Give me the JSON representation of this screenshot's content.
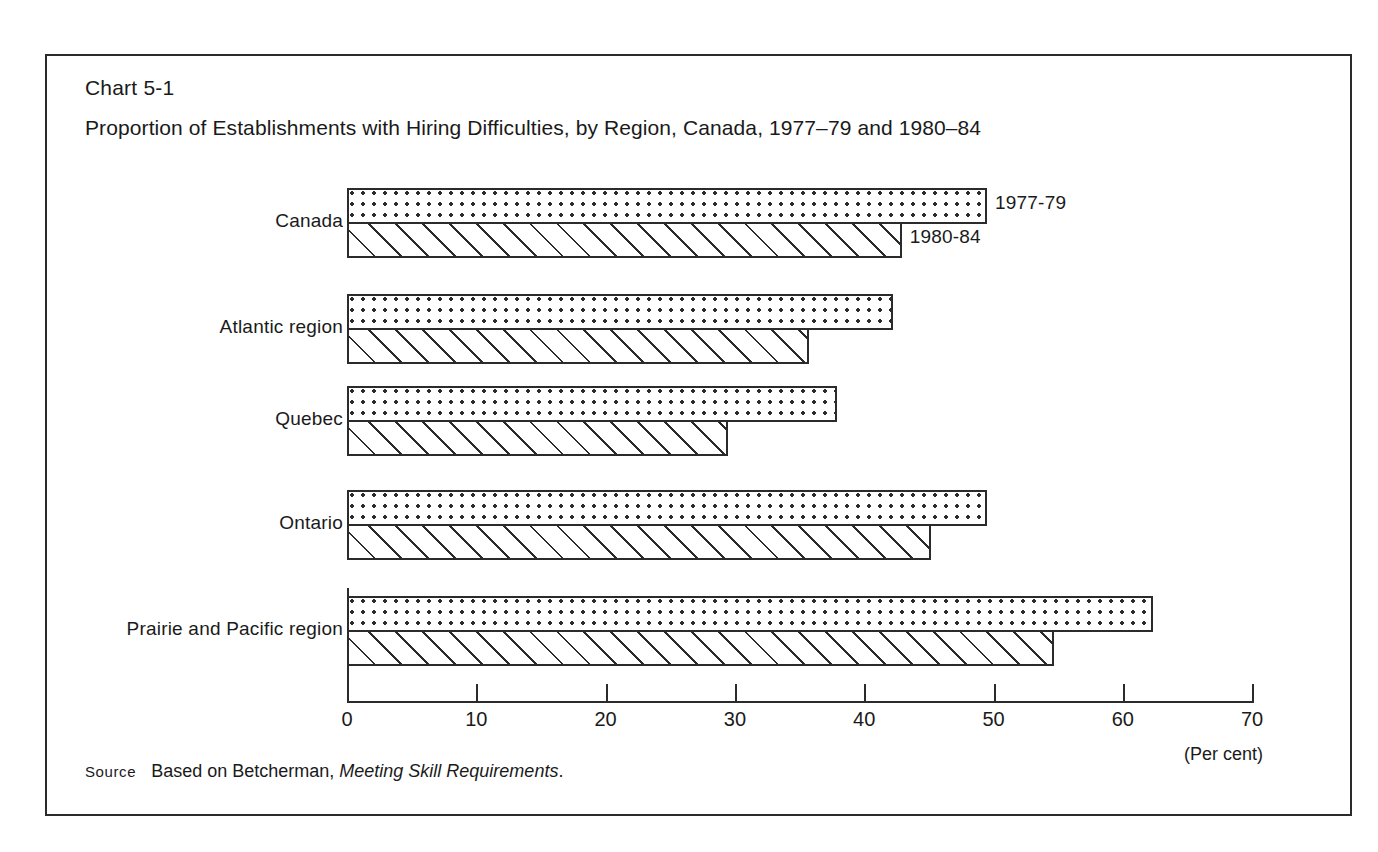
{
  "figure": {
    "chart_number": "Chart 5-1",
    "title": "Proportion of Establishments with Hiring Difficulties, by Region, Canada, 1977–79 and 1980–84",
    "source": {
      "label": "Source",
      "text_before": "Based on Betcherman,",
      "italic_title": "Meeting Skill Requirements",
      "text_after": "."
    },
    "axis_unit": "(Per cent)",
    "border_color": "#2b2b2b",
    "ink_color": "#2b2b2b"
  },
  "chart_data": {
    "type": "bar",
    "orientation": "horizontal",
    "xlabel": "(Per cent)",
    "ylabel": "",
    "xlim": [
      0,
      70
    ],
    "xticks": [
      0,
      10,
      20,
      30,
      40,
      50,
      60,
      70
    ],
    "xticklabels": [
      "0",
      "10",
      "20",
      "30",
      "40",
      "50",
      "60",
      "70"
    ],
    "grid": false,
    "legend_position": "inline-right-of-first-group",
    "categories": [
      "Canada",
      "Atlantic region",
      "Quebec",
      "Ontario",
      "Prairie and Pacific region"
    ],
    "series": [
      {
        "name": "1977-79",
        "pattern": "dotted",
        "values": [
          49.5,
          42.2,
          37.9,
          49.5,
          62.3
        ]
      },
      {
        "name": "1980-84",
        "pattern": "hatched",
        "values": [
          42.9,
          35.7,
          29.5,
          45.2,
          54.7
        ]
      }
    ]
  }
}
